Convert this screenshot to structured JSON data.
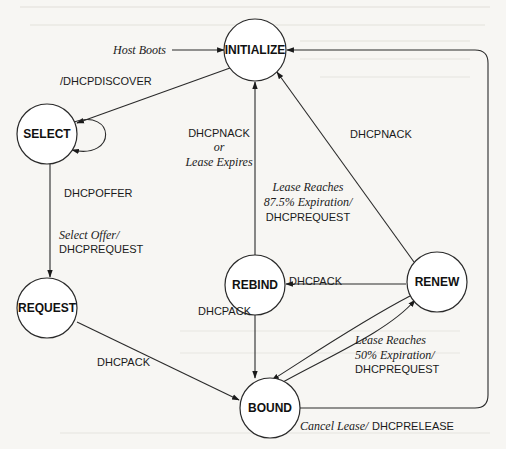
{
  "diagram": {
    "states": [
      {
        "id": "initialize",
        "label": "INITIALIZE",
        "cx": 255,
        "cy": 50,
        "r": 31
      },
      {
        "id": "select",
        "label": "SELECT",
        "cx": 47,
        "cy": 134,
        "r": 30
      },
      {
        "id": "request",
        "label": "REQUEST",
        "cx": 47,
        "cy": 308,
        "r": 30
      },
      {
        "id": "rebind",
        "label": "REBIND",
        "cx": 255,
        "cy": 285,
        "r": 30
      },
      {
        "id": "renew",
        "label": "RENEW",
        "cx": 437,
        "cy": 282,
        "r": 30
      },
      {
        "id": "bound",
        "label": "BOUND",
        "cx": 270,
        "cy": 408,
        "r": 30
      }
    ],
    "transitions": [
      {
        "from": "start",
        "to": "initialize",
        "event": "Host Boots",
        "action": ""
      },
      {
        "from": "initialize",
        "to": "select",
        "event": "",
        "action": "/DHCPDISCOVER"
      },
      {
        "from": "select",
        "to": "select",
        "event": "",
        "action": "DHCPOFFER"
      },
      {
        "from": "select",
        "to": "request",
        "event": "Select Offer/",
        "action": "DHCPREQUEST"
      },
      {
        "from": "request",
        "to": "bound",
        "event": "",
        "action": "DHCPACK"
      },
      {
        "from": "rebind",
        "to": "initialize",
        "event_line1": "DHCPNACK",
        "event_line2": "or",
        "event_line3": "Lease Expires"
      },
      {
        "from": "rebind",
        "to": "bound",
        "event": "",
        "action": "DHCPACK"
      },
      {
        "from": "renew",
        "to": "initialize",
        "event": "",
        "action": "DHCPNACK"
      },
      {
        "from": "renew",
        "to": "rebind",
        "event_line1": "Lease  Reaches",
        "event_line2": "87.5% Expiration/",
        "action": "DHCPREQUEST"
      },
      {
        "from": "renew",
        "to": "bound",
        "event": "",
        "action": "DHCPACK"
      },
      {
        "from": "bound",
        "to": "renew",
        "event_line1": "Lease  Reaches",
        "event_line2": "50% Expiration/",
        "action": "DHCPREQUEST"
      },
      {
        "from": "bound",
        "to": "initialize",
        "event": "Cancel Lease/",
        "action": "DHCPRELEASE"
      }
    ]
  },
  "labels": {
    "host_boots": "Host Boots",
    "dhcpdiscover": "/DHCPDISCOVER",
    "dhcpoffer": "DHCPOFFER",
    "select_offer": "Select Offer/",
    "select_request": "DHCPREQUEST",
    "request_ack": "DHCPACK",
    "rebind_nack_1": "DHCPNACK",
    "rebind_nack_2": "or",
    "rebind_nack_3": "Lease Expires",
    "rebind_ack": "DHCPACK",
    "renew_nack": "DHCPNACK",
    "renew_rebind_1": "Lease  Reaches",
    "renew_rebind_2": "87.5% Expiration/",
    "renew_rebind_3": "DHCPREQUEST",
    "renew_ack": "DHCPACK",
    "bound_renew_1": "Lease  Reaches",
    "bound_renew_2": "50% Expiration/",
    "bound_renew_3": "DHCPREQUEST",
    "cancel_lease": "Cancel Lease/",
    "dhcprelease": "DHCPRELEASE"
  }
}
